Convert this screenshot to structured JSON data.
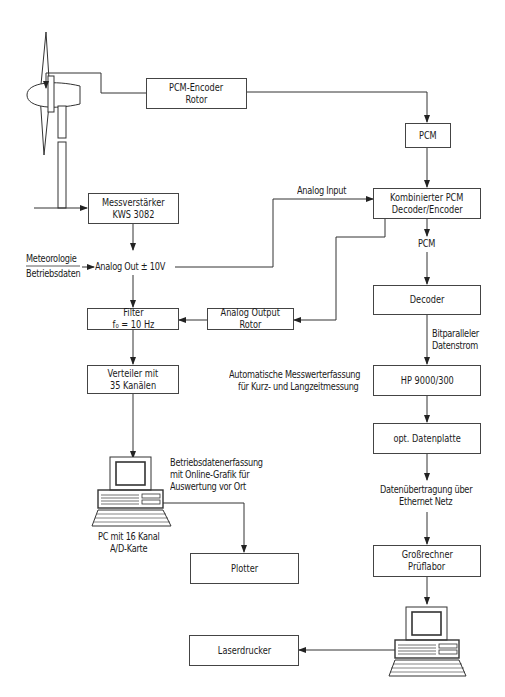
{
  "diagram": {
    "boxes": {
      "pcm_encoder_rotor": [
        "PCM-Encoder",
        "Rotor"
      ],
      "pcm_top": [
        "PCM"
      ],
      "kombinierter": [
        "Kombinierter PCM",
        "Decoder/Encoder"
      ],
      "messverstaerker": [
        "Messverstärker",
        "KWS 3082"
      ],
      "filter": [
        "Filter",
        "f₀ = 10 Hz"
      ],
      "analog_output_rotor": [
        "Analog Output",
        "Rotor"
      ],
      "verteiler": [
        "Verteiler mit",
        "35 Kanälen"
      ],
      "decoder": [
        "Decoder"
      ],
      "hp": [
        "HP 9000/300"
      ],
      "datenplatte": [
        "opt. Datenplatte"
      ],
      "grossrechner": [
        "Großrechner",
        "Prüflabor"
      ],
      "plotter": [
        "Plotter"
      ],
      "laserdrucker": [
        "Laserdrucker"
      ]
    },
    "labels": {
      "analog_input": "Analog Input",
      "meteorologie": "Meteorologie",
      "betriebsdaten": "Betriebsdaten",
      "analog_out": "Analog Out  ±  10V",
      "pcm_mid": "PCM",
      "bitparalleler_1": "Bitparalleler",
      "bitparalleler_2": "Datenstrom",
      "automatische_1": "Automatische Messwerterfassung",
      "automatische_2": "für Kurz- und Langzeitmessung",
      "betriebsdatenerfassung_1": "Betriebsdatenerfassung",
      "betriebsdatenerfassung_2": "mit Online-Grafik für",
      "betriebsdatenerfassung_3": "Auswertung vor Ort",
      "pc_1": "PC mit 16 Kanal",
      "pc_2": "A/D-Karte",
      "datenuebertragung_1": "Datenübertragung über",
      "datenuebertragung_2": "Ethernet Netz"
    },
    "icons": [
      "wind-turbine-icon",
      "pc-workstation-icon",
      "pc-workstation-icon"
    ],
    "line_color": "#333333"
  }
}
